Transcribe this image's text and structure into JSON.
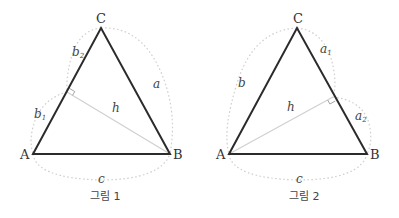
{
  "figures": [
    {
      "caption": "그림 1",
      "vertices": {
        "A": "A",
        "B": "B",
        "C": "C"
      },
      "labels": {
        "b1": "b",
        "b1_sub": "1",
        "b2": "b",
        "b2_sub": "2",
        "a": "a",
        "c": "c",
        "h": "h"
      },
      "description": "Triangle ABC with altitude h from B perpendicular to side AC, dividing b into b1 and b2"
    },
    {
      "caption": "그림 2",
      "vertices": {
        "A": "A",
        "B": "B",
        "C": "C"
      },
      "labels": {
        "a1": "a",
        "a1_sub": "1",
        "a2": "a",
        "a2_sub": "2",
        "b": "b",
        "c": "c",
        "h": "h"
      },
      "description": "Triangle ABC with altitude h from A perpendicular to side BC, dividing a into a1 and a2"
    }
  ],
  "colors": {
    "triangle_stroke": "#2b2b2b",
    "altitude_stroke": "#cfcfcf",
    "arc_stroke": "#cfcfcf",
    "text": "#333333"
  }
}
